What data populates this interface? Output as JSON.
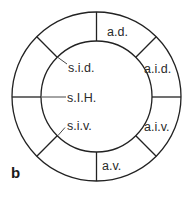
{
  "figure": {
    "panel_label": "b",
    "colors": {
      "line": "#222222",
      "text": "#2a2a2a",
      "background": "#ffffff"
    }
  },
  "segments": {
    "a_d": "a.d.",
    "a_i_d": "a.i.d.",
    "a_i_v": "a.i.v.",
    "a_v": "a.v."
  },
  "pointer_labels": {
    "s_i_d": "s.i.d.",
    "s_l_h": "s.I.H.",
    "s_i_v": "s.i.v."
  }
}
